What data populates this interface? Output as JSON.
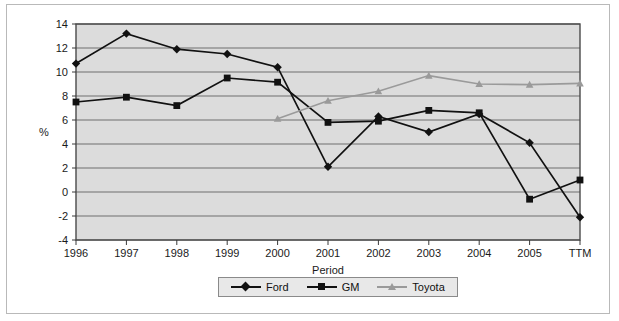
{
  "chart_data": {
    "type": "line",
    "title": "",
    "xlabel": "Period",
    "ylabel": "%",
    "categories": [
      "1996",
      "1997",
      "1998",
      "1999",
      "2000",
      "2001",
      "2002",
      "2003",
      "2004",
      "2005",
      "TTM"
    ],
    "ylim": [
      -4,
      14
    ],
    "yticks": [
      -4,
      -2,
      0,
      2,
      4,
      6,
      8,
      10,
      12,
      14
    ],
    "ytick_labels": [
      "-4",
      "-2",
      "0",
      "2",
      "4",
      "6",
      "8",
      "10",
      "12",
      "14"
    ],
    "grid": true,
    "legend_position": "bottom",
    "series": [
      {
        "name": "Ford",
        "marker": "diamond",
        "color": "#111111",
        "values": [
          10.7,
          13.2,
          11.9,
          11.5,
          10.4,
          2.1,
          6.3,
          5.0,
          6.5,
          4.1,
          -2.1
        ]
      },
      {
        "name": "GM",
        "marker": "square",
        "color": "#111111",
        "values": [
          7.5,
          7.9,
          7.2,
          9.5,
          9.15,
          5.8,
          5.9,
          6.8,
          6.6,
          -0.6,
          1.0
        ]
      },
      {
        "name": "Toyota",
        "marker": "triangle",
        "color": "#9a9a9a",
        "values": [
          null,
          null,
          null,
          null,
          6.1,
          7.6,
          8.4,
          9.7,
          9.0,
          8.95,
          9.05
        ]
      }
    ]
  },
  "legend": {
    "items": [
      {
        "label": "Ford"
      },
      {
        "label": "GM"
      },
      {
        "label": "Toyota"
      }
    ]
  },
  "axes": {
    "x_title": "Period",
    "y_title": "%"
  },
  "style": {
    "plot_background": "#dcdcdc",
    "grid_color": "#6f6f6f",
    "frame_color": "#4a4a4a",
    "ford_color": "#111111",
    "gm_color": "#111111",
    "toyota_color": "#9a9a9a",
    "page_background": "#ffffff",
    "outer_border": "#b9b9b9"
  }
}
